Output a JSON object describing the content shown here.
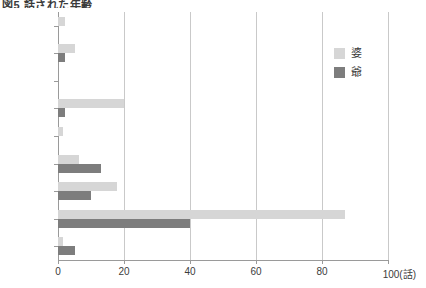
{
  "chart_data": {
    "type": "bar",
    "orientation": "horizontal",
    "title": "図5  話された年齢",
    "categories": [
      "81歳以上",
      "80歳",
      "72歳",
      "70歳",
      "65歳",
      "62歳",
      "61歳",
      "60歳",
      "50歳"
    ],
    "series": [
      {
        "name": "婆",
        "color": "#d6d6d6",
        "values": [
          2,
          5,
          0,
          20,
          1.5,
          6.5,
          18,
          87,
          1.5
        ]
      },
      {
        "name": "爺",
        "color": "#7d7d7d",
        "values": [
          0,
          2,
          0,
          2,
          0,
          13,
          10,
          40,
          5
        ]
      }
    ],
    "xlabel": "",
    "ylabel": "",
    "xlim": [
      0,
      100
    ],
    "xticks": [
      0,
      20,
      40,
      60,
      80,
      100
    ],
    "xtick_labels": [
      "0",
      "20",
      "40",
      "60",
      "80",
      "100(話)"
    ],
    "xunit": "話",
    "grid": "vertical",
    "legend_position": "top-right"
  }
}
